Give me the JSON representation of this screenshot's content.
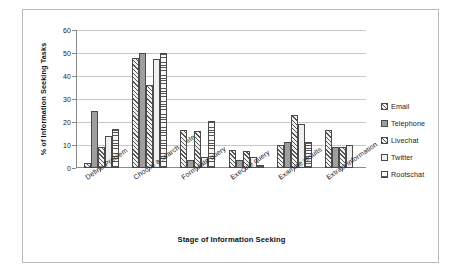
{
  "chart_data": {
    "type": "bar",
    "title": "",
    "xlabel": "Stage of Information Seeking",
    "ylabel": "% of Information Seeking Tasks",
    "ylim": [
      0,
      60
    ],
    "yticks": [
      0,
      10,
      20,
      30,
      40,
      50,
      60
    ],
    "grid": true,
    "legend_position": "right",
    "categories": [
      "Define Problem",
      "Choose a search system",
      "Formulate query",
      "Execute query",
      "Examine results",
      "Extract information"
    ],
    "series": [
      {
        "name": "Email",
        "values": [
          2,
          48,
          16.5,
          8,
          10,
          16.5
        ]
      },
      {
        "name": "Telephone",
        "values": [
          25,
          50,
          3.5,
          3.5,
          11.5,
          9
        ]
      },
      {
        "name": "Livechat",
        "values": [
          9,
          36,
          16,
          7.5,
          23,
          9
        ]
      },
      {
        "name": "Twitter",
        "values": [
          14,
          47.5,
          5,
          5,
          19,
          10
        ]
      },
      {
        "name": "Rootschat",
        "values": [
          17,
          50,
          20.5,
          1.5,
          11.5,
          0
        ]
      }
    ]
  },
  "legend": {
    "items": [
      {
        "label": "Email",
        "swatch": "diagonal-hatch"
      },
      {
        "label": "Telephone",
        "swatch": "solid-gray"
      },
      {
        "label": "Livechat",
        "swatch": "diagonal-hatch"
      },
      {
        "label": "Twitter",
        "swatch": "solid-light"
      },
      {
        "label": "Rootschat",
        "swatch": "horizontal-stripe"
      }
    ]
  }
}
